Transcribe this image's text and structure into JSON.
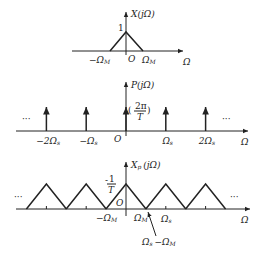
{
  "figure": {
    "panel_top": {
      "y_label": "X(jΩ)",
      "peak_label": "1",
      "neg_limit_label": "−Ω",
      "neg_limit_sub": "M",
      "origin_label": "O",
      "pos_limit_label": "Ω",
      "pos_limit_sub": "M",
      "x_axis_label": "Ω",
      "shape": "triangle",
      "peak_value": 1
    },
    "panel_middle": {
      "y_label": "P(jΩ)",
      "impulse_weight_label_open": "(",
      "impulse_weight_num": "2π",
      "impulse_weight_den": "T",
      "impulse_weight_label_close": ")",
      "ellipsis_left": "···",
      "ellipsis_right": "···",
      "origin_label": "O",
      "x_axis_label": "Ω",
      "impulses": [
        {
          "label": "−2Ω",
          "sub": "s",
          "k": -2
        },
        {
          "label": "−Ω",
          "sub": "s",
          "k": -1
        },
        {
          "label": "",
          "sub": "",
          "k": 0
        },
        {
          "label": "Ω",
          "sub": "s",
          "k": 1
        },
        {
          "label": "2Ω",
          "sub": "s",
          "k": 2
        }
      ]
    },
    "panel_bottom": {
      "y_label": "X",
      "y_label_sub": "p",
      "y_label_arg": "(jΩ)",
      "peak_num": "1",
      "peak_den": "T",
      "origin_label": "O",
      "neg_limit_label": "−Ω",
      "neg_limit_sub": "M",
      "pos_limit_label": "Ω",
      "pos_limit_sub": "M",
      "sample_label": "Ω",
      "sample_sub": "s",
      "annotation_a": "Ω",
      "annotation_a_sub": "s",
      "annotation_b": "−Ω",
      "annotation_b_sub": "M",
      "ellipsis_left": "···",
      "ellipsis_right": "···",
      "x_axis_label": "Ω",
      "replica_shifts": [
        -2,
        -1,
        0,
        1,
        2
      ]
    }
  }
}
